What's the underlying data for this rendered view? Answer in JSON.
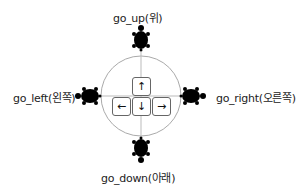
{
  "diagram": {
    "labels": {
      "up": "go_up(위)",
      "down": "go_down(아래)",
      "left": "go_left(왼쪽)",
      "right": "go_right(오른쪽)"
    },
    "keys": {
      "up": "↑",
      "down": "↓",
      "left": "←",
      "right": "→"
    },
    "icons": [
      "turtle-icon-up",
      "turtle-icon-down",
      "turtle-icon-left",
      "turtle-icon-right"
    ],
    "colors": {
      "circle": "#aaaaaa",
      "turtle": "#000000",
      "key_border": "#666666"
    }
  }
}
